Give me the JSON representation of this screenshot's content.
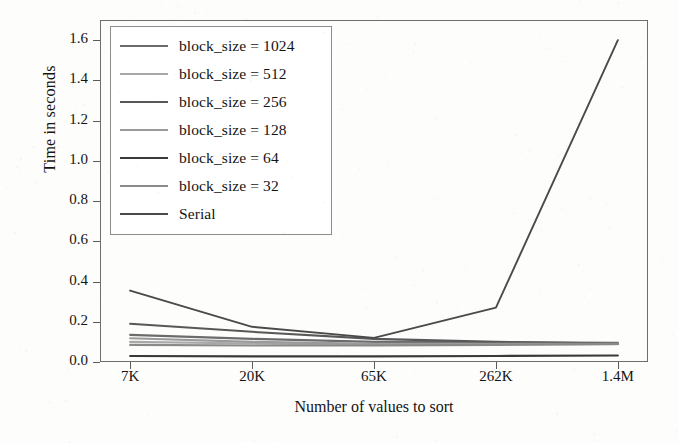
{
  "chart_data": {
    "type": "line",
    "title": "",
    "xlabel": "Number of values to sort",
    "ylabel": "Time in seconds",
    "categories": [
      "7K",
      "20K",
      "65K",
      "262K",
      "1.4M"
    ],
    "ylim": [
      0.0,
      1.7
    ],
    "yticks": [
      "0.0",
      "0.2",
      "0.4",
      "0.6",
      "0.8",
      "1.0",
      "1.2",
      "1.4",
      "1.6"
    ],
    "ytick_values": [
      0.0,
      0.2,
      0.4,
      0.6,
      0.8,
      1.0,
      1.2,
      1.4,
      1.6
    ],
    "grid": false,
    "legend_position": "upper-left",
    "series": [
      {
        "name": "block_size = 1024",
        "values": [
          0.135,
          0.115,
          0.1,
          0.098,
          0.095
        ],
        "color": "#6b6b6b"
      },
      {
        "name": "block_size = 512",
        "values": [
          0.1,
          0.092,
          0.085,
          0.086,
          0.088
        ],
        "color": "#a8a8a8"
      },
      {
        "name": "block_size = 256",
        "values": [
          0.19,
          0.15,
          0.115,
          0.1,
          0.092
        ],
        "color": "#585858"
      },
      {
        "name": "block_size = 128",
        "values": [
          0.118,
          0.1,
          0.09,
          0.09,
          0.09
        ],
        "color": "#9a9a9a"
      },
      {
        "name": "block_size = 64",
        "values": [
          0.03,
          0.028,
          0.028,
          0.03,
          0.032
        ],
        "color": "#3a3a3a"
      },
      {
        "name": "block_size = 32",
        "values": [
          0.085,
          0.082,
          0.082,
          0.085,
          0.09
        ],
        "color": "#8a8a8a"
      },
      {
        "name": "Serial",
        "values": [
          0.355,
          0.175,
          0.12,
          0.27,
          1.6
        ],
        "color": "#4a4a4a"
      }
    ]
  },
  "axes": {
    "ylabel": "Time in seconds",
    "xlabel": "Number of values to sort"
  }
}
